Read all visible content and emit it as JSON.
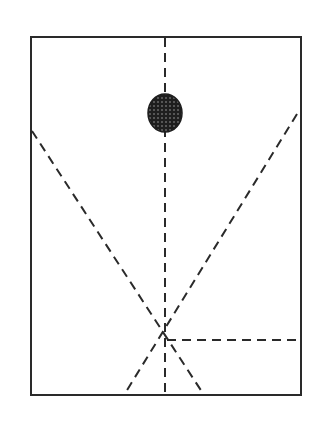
{
  "diagram": {
    "width": 324,
    "height": 429,
    "stroke_color": "#2a2a2a",
    "frame": {
      "x": 31,
      "y": 37,
      "width": 270,
      "height": 358
    },
    "dot": {
      "cx": 165,
      "cy": 113,
      "rx": 17,
      "ry": 19,
      "fill": "#1e1e1e"
    },
    "lines": [
      {
        "name": "vertical-center-line",
        "x1": 165,
        "y1": 38,
        "x2": 165,
        "y2": 395
      },
      {
        "name": "left-diagonal-line",
        "x1": 32,
        "y1": 131,
        "x2": 204,
        "y2": 395
      },
      {
        "name": "right-diagonal-line",
        "x1": 297,
        "y1": 114,
        "x2": 124,
        "y2": 395
      },
      {
        "name": "horizontal-right-line",
        "x1": 167,
        "y1": 340,
        "x2": 301,
        "y2": 340
      }
    ]
  }
}
